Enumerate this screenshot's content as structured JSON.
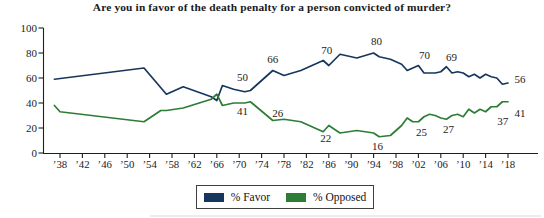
{
  "title": "Are you in favor of the death penalty for a person convicted of murder?",
  "legend": {
    "items": [
      {
        "key": "favor",
        "label": "% Favor",
        "color": "#17365d"
      },
      {
        "key": "opposed",
        "label": "% Opposed",
        "color": "#2e7d36"
      }
    ]
  },
  "chart_data": {
    "type": "line",
    "title": "Are you in favor of the death penalty for a person convicted of murder?",
    "xlabel": "",
    "ylabel": "",
    "ylim": [
      0,
      100
    ],
    "yticks": [
      0,
      20,
      40,
      60,
      80,
      100
    ],
    "xtick_years": [
      1938,
      1942,
      1946,
      1950,
      1954,
      1958,
      1962,
      1966,
      1970,
      1974,
      1978,
      1982,
      1986,
      1990,
      1994,
      1998,
      2002,
      2006,
      2010,
      2014,
      2018
    ],
    "xtick_labels": [
      "’38",
      "’42",
      "’46",
      "’50",
      "’54",
      "’58",
      "’62",
      "’66",
      "’70",
      "’74",
      "’78",
      "’82",
      "’86",
      "’90",
      "’94",
      "’98",
      "’02",
      "’06",
      "’10",
      "’14",
      "’18"
    ],
    "grid": false,
    "legend_position": "bottom",
    "series": [
      {
        "key": "favor",
        "name": "% Favor",
        "color": "#17365d",
        "points": [
          [
            1937,
            59
          ],
          [
            1953,
            68
          ],
          [
            1957,
            47
          ],
          [
            1960,
            53
          ],
          [
            1965,
            45
          ],
          [
            1966,
            42
          ],
          [
            1967,
            54
          ],
          [
            1969,
            51
          ],
          [
            1971,
            49
          ],
          [
            1972,
            50
          ],
          [
            1976,
            66
          ],
          [
            1978,
            62
          ],
          [
            1981,
            66
          ],
          [
            1985,
            74
          ],
          [
            1986,
            70
          ],
          [
            1988,
            79
          ],
          [
            1991,
            76
          ],
          [
            1994,
            80
          ],
          [
            1995,
            77
          ],
          [
            1997,
            75
          ],
          [
            1999,
            71
          ],
          [
            2000,
            66
          ],
          [
            2001,
            68
          ],
          [
            2002,
            70
          ],
          [
            2003,
            64
          ],
          [
            2004,
            64
          ],
          [
            2005,
            64
          ],
          [
            2006,
            65
          ],
          [
            2007,
            69
          ],
          [
            2008,
            64
          ],
          [
            2009,
            65
          ],
          [
            2010,
            64
          ],
          [
            2011,
            61
          ],
          [
            2012,
            63
          ],
          [
            2013,
            60
          ],
          [
            2014,
            63
          ],
          [
            2015,
            61
          ],
          [
            2016,
            60
          ],
          [
            2017,
            55
          ],
          [
            2018,
            56
          ]
        ],
        "labels": [
          {
            "year": 1972,
            "value": 50,
            "text": "50",
            "dx": -8,
            "dy": -13
          },
          {
            "year": 1976,
            "value": 66,
            "text": "66",
            "dx": 0,
            "dy": -11
          },
          {
            "year": 1986,
            "value": 70,
            "text": "70",
            "dx": -2,
            "dy": -15
          },
          {
            "year": 1994,
            "value": 80,
            "text": "80",
            "dx": 3,
            "dy": -12
          },
          {
            "year": 2002,
            "value": 70,
            "text": "70",
            "dx": 6,
            "dy": -10
          },
          {
            "year": 2007,
            "value": 69,
            "text": "69",
            "dx": 5,
            "dy": -10
          },
          {
            "year": 2018,
            "value": 56,
            "text": "56",
            "dx": 12,
            "dy": -4
          }
        ]
      },
      {
        "key": "opposed",
        "name": "% Opposed",
        "color": "#2e7d36",
        "points": [
          [
            1937,
            38
          ],
          [
            1938,
            33
          ],
          [
            1953,
            25
          ],
          [
            1956,
            34
          ],
          [
            1957,
            34
          ],
          [
            1960,
            36
          ],
          [
            1965,
            43
          ],
          [
            1966,
            47
          ],
          [
            1967,
            38
          ],
          [
            1969,
            40
          ],
          [
            1971,
            40
          ],
          [
            1972,
            41
          ],
          [
            1976,
            26
          ],
          [
            1978,
            27
          ],
          [
            1981,
            25
          ],
          [
            1985,
            17
          ],
          [
            1986,
            22
          ],
          [
            1988,
            16
          ],
          [
            1991,
            18
          ],
          [
            1994,
            16
          ],
          [
            1995,
            13
          ],
          [
            1997,
            14
          ],
          [
            1999,
            22
          ],
          [
            2000,
            28
          ],
          [
            2001,
            25
          ],
          [
            2002,
            25
          ],
          [
            2003,
            29
          ],
          [
            2004,
            31
          ],
          [
            2005,
            30
          ],
          [
            2006,
            28
          ],
          [
            2007,
            27
          ],
          [
            2008,
            30
          ],
          [
            2009,
            31
          ],
          [
            2010,
            29
          ],
          [
            2011,
            35
          ],
          [
            2012,
            32
          ],
          [
            2013,
            35
          ],
          [
            2014,
            33
          ],
          [
            2015,
            37
          ],
          [
            2016,
            37
          ],
          [
            2017,
            41
          ],
          [
            2018,
            41
          ]
        ],
        "labels": [
          {
            "year": 1972,
            "value": 41,
            "text": "41",
            "dx": -8,
            "dy": 9
          },
          {
            "year": 1976,
            "value": 26,
            "text": "26",
            "dx": 5,
            "dy": -7
          },
          {
            "year": 1986,
            "value": 22,
            "text": "22",
            "dx": -3,
            "dy": 13
          },
          {
            "year": 1994,
            "value": 16,
            "text": "16",
            "dx": 4,
            "dy": 13
          },
          {
            "year": 2002,
            "value": 25,
            "text": "25",
            "dx": 3,
            "dy": 10
          },
          {
            "year": 2007,
            "value": 27,
            "text": "27",
            "dx": 2,
            "dy": 10
          },
          {
            "year": 2016,
            "value": 37,
            "text": "37",
            "dx": 6,
            "dy": 14
          },
          {
            "year": 2018,
            "value": 41,
            "text": "41",
            "dx": 12,
            "dy": 11
          }
        ]
      }
    ]
  }
}
